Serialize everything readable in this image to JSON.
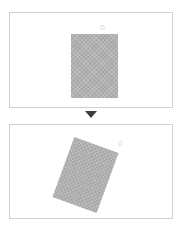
{
  "figure": {
    "title": "",
    "type": "before-after-rotation-illustration",
    "background_color": "#ffffff",
    "panel_border_color": "#cfcfcf"
  },
  "panels": [
    {
      "id": "before",
      "label": "",
      "shape": {
        "name": "hatched-rectangle",
        "fill_color": "#a8a8a8",
        "pattern": "cross-hatch",
        "rotation_degrees": 0,
        "width_px": 47,
        "height_px": 64
      },
      "marker": {
        "name": "anchor-point",
        "shape": "circle",
        "color": "#dedede",
        "position": "above-top-center"
      }
    },
    {
      "id": "after",
      "label": "",
      "shape": {
        "name": "hatched-rectangle",
        "fill_color": "#a8a8a8",
        "pattern": "cross-hatch",
        "rotation_degrees": 20,
        "width_px": 47,
        "height_px": 64
      },
      "marker": {
        "name": "anchor-point",
        "shape": "circle",
        "color": "#dedede",
        "position": "upper-right"
      }
    }
  ],
  "connector": {
    "name": "arrow-down",
    "glyph": "▼",
    "color": "#3d3d3d",
    "direction": "down"
  }
}
